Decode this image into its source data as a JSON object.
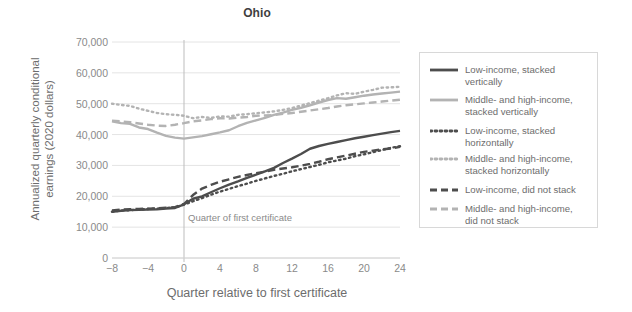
{
  "chart_data": {
    "type": "line",
    "title": "Ohio",
    "xlabel": "Quarter relative to first certificate",
    "ylabel_line1": "Annualized quarterly conditional",
    "ylabel_line2": "earnings (2020 dollars)",
    "xlim": [
      -8,
      24
    ],
    "ylim": [
      0,
      70000
    ],
    "xticks": [
      "−8",
      "−4",
      "0",
      "4",
      "8",
      "12",
      "16",
      "20",
      "24"
    ],
    "xtick_values": [
      -8,
      -4,
      0,
      4,
      8,
      12,
      16,
      20,
      24
    ],
    "yticks": [
      "0",
      "10,000",
      "20,000",
      "30,000",
      "40,000",
      "50,000",
      "60,000",
      "70,000"
    ],
    "ytick_values": [
      0,
      10000,
      20000,
      30000,
      40000,
      50000,
      60000,
      70000
    ],
    "grid": "horizontal",
    "legend_position": "right",
    "annotation": {
      "text": "Quarter of first certificate",
      "x": 0,
      "y": 13000
    },
    "x": [
      -8,
      -7,
      -6,
      -5,
      -4,
      -3,
      -2,
      -1,
      0,
      1,
      2,
      3,
      4,
      5,
      6,
      7,
      8,
      9,
      10,
      11,
      12,
      13,
      14,
      15,
      16,
      17,
      18,
      19,
      20,
      21,
      22,
      23,
      24
    ],
    "series": [
      {
        "name": "Low-income, stacked vertically",
        "color": "#4d4d4d",
        "style": "solid",
        "width": 2.4,
        "values": [
          15000,
          15300,
          15500,
          15600,
          15700,
          15800,
          16000,
          16200,
          17400,
          19200,
          20000,
          21300,
          22600,
          23800,
          24800,
          26000,
          27000,
          28100,
          29200,
          30800,
          32200,
          33700,
          35400,
          36300,
          37000,
          37600,
          38200,
          38800,
          39300,
          39800,
          40300,
          40800,
          41200
        ]
      },
      {
        "name": "Middle- and high-income, stacked vertically",
        "color": "#b3b3b3",
        "style": "solid",
        "width": 2.4,
        "values": [
          44300,
          43700,
          43500,
          42300,
          41800,
          40600,
          39600,
          39000,
          38700,
          39100,
          39500,
          40100,
          40700,
          41400,
          42700,
          43800,
          44600,
          45400,
          46400,
          47100,
          48000,
          48700,
          49500,
          50400,
          51200,
          51800,
          51600,
          52100,
          52600,
          53000,
          53300,
          53600,
          53900
        ]
      },
      {
        "name": "Low-income, stacked horizontally",
        "color": "#4d4d4d",
        "style": "dotted",
        "width": 2.4,
        "values": [
          15000,
          15400,
          15500,
          15700,
          15900,
          16000,
          16200,
          16400,
          17300,
          18400,
          19400,
          20500,
          21500,
          22400,
          23300,
          24100,
          25000,
          25800,
          26600,
          27300,
          28100,
          28800,
          29500,
          30200,
          31000,
          31600,
          32200,
          33000,
          33600,
          34300,
          35000,
          35700,
          36200
        ]
      },
      {
        "name": "Middle- and high-income, stacked horizontally",
        "color": "#b3b3b3",
        "style": "dotted",
        "width": 2.4,
        "values": [
          50000,
          49600,
          49300,
          48400,
          47700,
          47000,
          46600,
          46400,
          46100,
          45300,
          45700,
          45400,
          45900,
          45800,
          46400,
          46600,
          46900,
          47200,
          47500,
          48000,
          48600,
          49400,
          50200,
          51000,
          51800,
          52700,
          53400,
          53200,
          53900,
          54500,
          55200,
          55300,
          55500
        ]
      },
      {
        "name": "Low-income, did not stack",
        "color": "#4d4d4d",
        "style": "dashed",
        "width": 2.4,
        "values": [
          15400,
          15700,
          15800,
          15900,
          16000,
          16100,
          16300,
          16500,
          17500,
          20400,
          22500,
          23700,
          24700,
          25500,
          26300,
          26900,
          27500,
          28000,
          28600,
          29000,
          29400,
          29900,
          30500,
          31200,
          32000,
          32600,
          33200,
          33800,
          34400,
          34800,
          35200,
          35500,
          36000
        ]
      },
      {
        "name": "Middle- and high-income, did not stack",
        "color": "#b3b3b3",
        "style": "dashed",
        "width": 2.4,
        "values": [
          44500,
          44300,
          44000,
          43600,
          43200,
          42900,
          42800,
          43200,
          43700,
          44300,
          44600,
          45000,
          45300,
          45200,
          45500,
          45700,
          46100,
          46200,
          46300,
          46700,
          47000,
          47400,
          47800,
          48200,
          48600,
          49100,
          49500,
          49800,
          50100,
          50400,
          50700,
          51000,
          51300
        ]
      }
    ]
  },
  "legend": {
    "items": [
      {
        "label": "Low-income, stacked\nvertically",
        "color": "#4d4d4d",
        "style": "solid"
      },
      {
        "label": "Middle- and high-income,\nstacked vertically",
        "color": "#b3b3b3",
        "style": "solid"
      },
      {
        "label": "Low-income, stacked\nhorizontally",
        "color": "#4d4d4d",
        "style": "dotted"
      },
      {
        "label": "Middle- and high-income,\nstacked horizontally",
        "color": "#b3b3b3",
        "style": "dotted"
      },
      {
        "label": "Low-income, did not stack",
        "color": "#4d4d4d",
        "style": "dashed"
      },
      {
        "label": "Middle- and high-income,\ndid not stack",
        "color": "#b3b3b3",
        "style": "dashed"
      }
    ]
  },
  "colors": {
    "low_income": "#4d4d4d",
    "high_income": "#b3b3b3",
    "grid": "#e4e4e4",
    "axis_text": "#8a8a8a",
    "title_text": "#3f3f3f"
  }
}
